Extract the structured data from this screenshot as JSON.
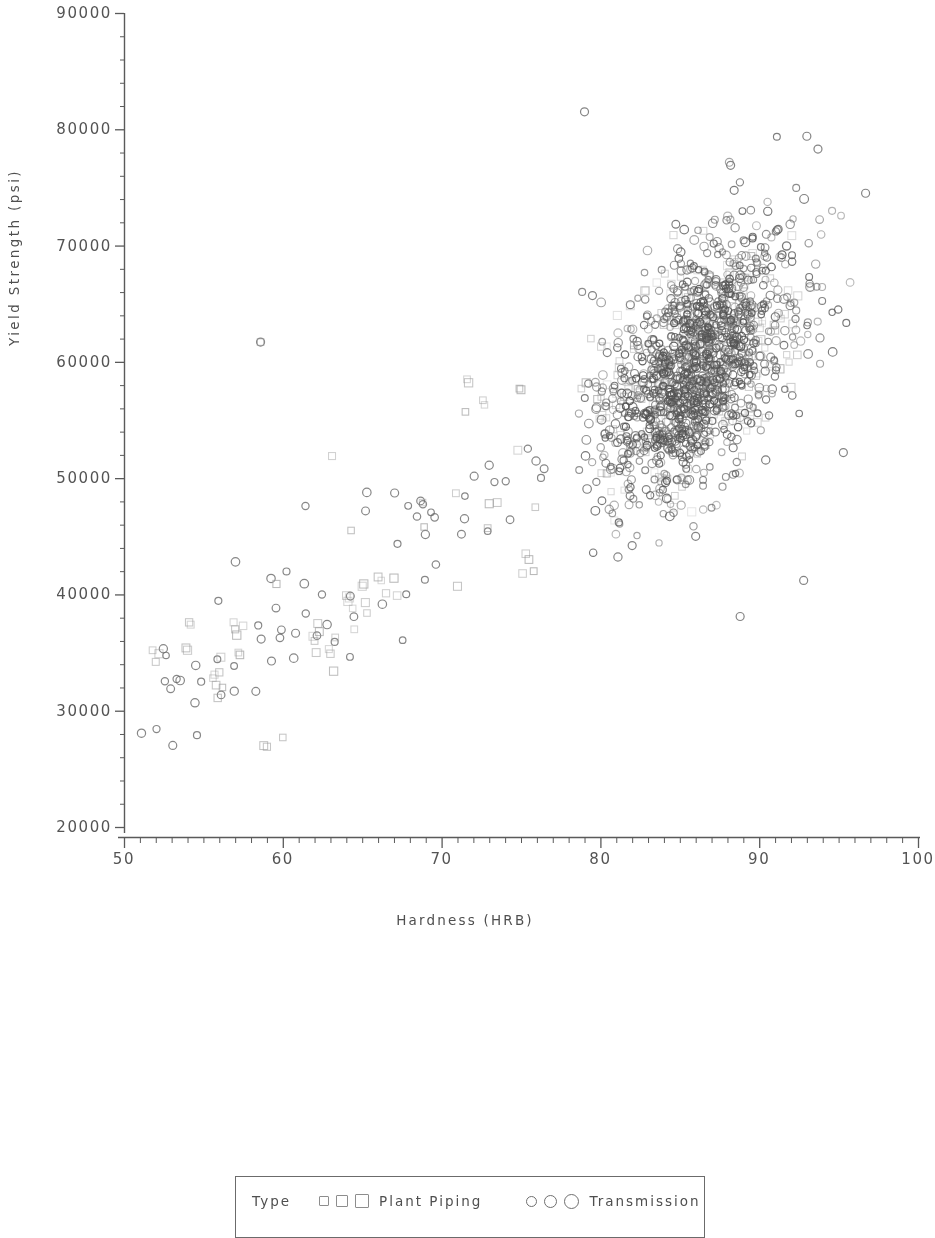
{
  "chart_data": {
    "type": "scatter",
    "title": "",
    "xlabel": "Hardness (HRB)",
    "ylabel": "Yield Strength (psi)",
    "xlim": [
      50,
      100
    ],
    "ylim": [
      20000,
      90000
    ],
    "grid": false,
    "xticks": [
      50,
      60,
      70,
      80,
      90,
      100
    ],
    "xtick_labels": [
      "50",
      "60",
      "70",
      "80",
      "90",
      "100"
    ],
    "x_minor_tick_step": 1,
    "yticks": [
      20000,
      30000,
      40000,
      50000,
      60000,
      70000,
      80000,
      90000
    ],
    "ytick_labels": [
      "20000",
      "30000",
      "40000",
      "50000",
      "60000",
      "70000",
      "80000",
      "90000"
    ],
    "y_minor_tick_step": 2000,
    "legend": {
      "position": "below-plot",
      "title": "Type",
      "entries": [
        {
          "name": "Plant Piping",
          "marker": "square",
          "color": "#8d8d8d"
        },
        {
          "name": "Transmission",
          "marker": "circle",
          "color": "#6f6f6f"
        }
      ]
    },
    "series": [
      {
        "name": "Plant Piping",
        "marker": "square",
        "color": "#9a9a9a",
        "n_points": 150,
        "cluster": {
          "sparse_band": {
            "x": [
              51,
              77
            ],
            "y": [
              30000,
              58000
            ],
            "fraction": 0.34
          },
          "dense_band": {
            "x": [
              79,
              93
            ],
            "y": [
              46000,
              74000
            ],
            "fraction": 0.66
          }
        },
        "points": [
          [
            51.8,
            35200
          ],
          [
            52.0,
            34200
          ],
          [
            52.2,
            34900
          ],
          [
            53.9,
            35400
          ],
          [
            54.0,
            35200
          ],
          [
            54.1,
            37600
          ],
          [
            54.2,
            37400
          ],
          [
            55.6,
            32800
          ],
          [
            55.7,
            33100
          ],
          [
            55.8,
            32200
          ],
          [
            55.9,
            31100
          ],
          [
            56.0,
            33300
          ],
          [
            56.1,
            34600
          ],
          [
            56.2,
            32000
          ],
          [
            56.9,
            37600
          ],
          [
            57.0,
            37000
          ],
          [
            57.1,
            36500
          ],
          [
            57.2,
            35000
          ],
          [
            57.3,
            34800
          ],
          [
            57.5,
            37300
          ],
          [
            58.6,
            61700
          ],
          [
            58.8,
            27000
          ],
          [
            59.0,
            26900
          ],
          [
            59.6,
            40900
          ],
          [
            60.0,
            27700
          ],
          [
            61.9,
            36400
          ],
          [
            62.0,
            36000
          ],
          [
            62.1,
            35000
          ],
          [
            62.2,
            37500
          ],
          [
            62.3,
            36800
          ],
          [
            62.9,
            35300
          ],
          [
            63.0,
            34900
          ],
          [
            63.1,
            51900
          ],
          [
            63.2,
            33400
          ],
          [
            63.3,
            36300
          ],
          [
            64.0,
            39900
          ],
          [
            64.1,
            39400
          ],
          [
            64.2,
            39700
          ],
          [
            64.3,
            45500
          ],
          [
            64.4,
            38800
          ],
          [
            64.5,
            37000
          ],
          [
            65.0,
            40700
          ],
          [
            65.1,
            40900
          ],
          [
            65.2,
            39300
          ],
          [
            65.3,
            38400
          ],
          [
            66.0,
            41500
          ],
          [
            66.2,
            41200
          ],
          [
            66.5,
            40100
          ],
          [
            67.0,
            41400
          ],
          [
            67.2,
            39900
          ],
          [
            68.8,
            47900
          ],
          [
            68.9,
            45800
          ],
          [
            70.9,
            48700
          ],
          [
            71.0,
            40700
          ],
          [
            71.5,
            55700
          ],
          [
            71.6,
            58500
          ],
          [
            71.7,
            58200
          ],
          [
            72.6,
            56700
          ],
          [
            72.7,
            56300
          ],
          [
            72.9,
            45700
          ],
          [
            73.0,
            47800
          ],
          [
            73.5,
            47900
          ],
          [
            74.8,
            52400
          ],
          [
            74.9,
            57700
          ],
          [
            75.0,
            57600
          ],
          [
            75.1,
            41800
          ],
          [
            75.3,
            43500
          ],
          [
            75.5,
            43000
          ],
          [
            75.8,
            42000
          ],
          [
            75.9,
            47500
          ],
          [
            78.8,
            57700
          ],
          [
            79.1,
            58200
          ],
          [
            79.4,
            62000
          ],
          [
            79.8,
            56800
          ],
          [
            80.1,
            55400
          ],
          [
            80.4,
            50400
          ],
          [
            80.8,
            54200
          ],
          [
            81.2,
            59500
          ],
          [
            81.5,
            57000
          ],
          [
            81.9,
            52800
          ],
          [
            82.1,
            61400
          ],
          [
            82.4,
            57600
          ],
          [
            82.8,
            66100
          ],
          [
            83.0,
            53400
          ],
          [
            83.3,
            59800
          ],
          [
            83.7,
            58100
          ],
          [
            84.0,
            63200
          ],
          [
            84.2,
            56600
          ],
          [
            84.6,
            70900
          ],
          [
            84.9,
            54500
          ],
          [
            85.1,
            60700
          ],
          [
            85.4,
            65800
          ],
          [
            85.7,
            58300
          ],
          [
            86.0,
            62900
          ],
          [
            86.3,
            57100
          ],
          [
            86.6,
            52900
          ],
          [
            86.9,
            67400
          ],
          [
            87.1,
            61200
          ],
          [
            87.4,
            56300
          ],
          [
            87.7,
            64800
          ],
          [
            88.0,
            59100
          ],
          [
            88.3,
            66700
          ],
          [
            88.6,
            60300
          ],
          [
            88.9,
            55600
          ],
          [
            89.2,
            63400
          ],
          [
            89.5,
            69100
          ],
          [
            89.8,
            58800
          ],
          [
            90.1,
            61900
          ],
          [
            90.4,
            55200
          ],
          [
            90.7,
            67200
          ],
          [
            91.0,
            62700
          ],
          [
            91.3,
            59400
          ],
          [
            91.6,
            64100
          ],
          [
            92.0,
            57800
          ],
          [
            92.4,
            60600
          ]
        ]
      },
      {
        "name": "Transmission",
        "marker": "circle",
        "color": "#6f6f6f",
        "n_points": 820,
        "cluster": {
          "center": {
            "x": 86.0,
            "y": 59500
          },
          "x_spread": 3.3,
          "y_spread": 5600,
          "x_range": [
            78,
            97
          ],
          "y_range": [
            38000,
            82000
          ]
        },
        "notable_points": [
          [
            79.0,
            81500
          ],
          [
            58.6,
            61700
          ],
          [
            88.8,
            38100
          ],
          [
            96.7,
            74500
          ],
          [
            93.0,
            79400
          ],
          [
            93.7,
            78300
          ],
          [
            88.2,
            76900
          ],
          [
            79.5,
            65700
          ],
          [
            92.8,
            41200
          ],
          [
            82.0,
            44200
          ],
          [
            86.0,
            45000
          ],
          [
            95.3,
            52200
          ]
        ]
      }
    ]
  },
  "axes": {
    "y_title": "Yield Strength (psi)",
    "x_title": "Hardness (HRB)"
  },
  "legend": {
    "title": "Type",
    "entry_plant_piping": "Plant Piping",
    "entry_transmission": "Transmission"
  },
  "ticks": {
    "y": [
      "90000",
      "80000",
      "70000",
      "60000",
      "50000",
      "40000",
      "30000",
      "20000"
    ],
    "x": [
      "50",
      "60",
      "70",
      "80",
      "90",
      "100"
    ]
  },
  "colors": {
    "axis": "#5a5a5a",
    "text": "#4f4f4f",
    "square_marker": "#9a9a9a",
    "circle_marker": "#6f6f6f",
    "background": "#ffffff"
  }
}
